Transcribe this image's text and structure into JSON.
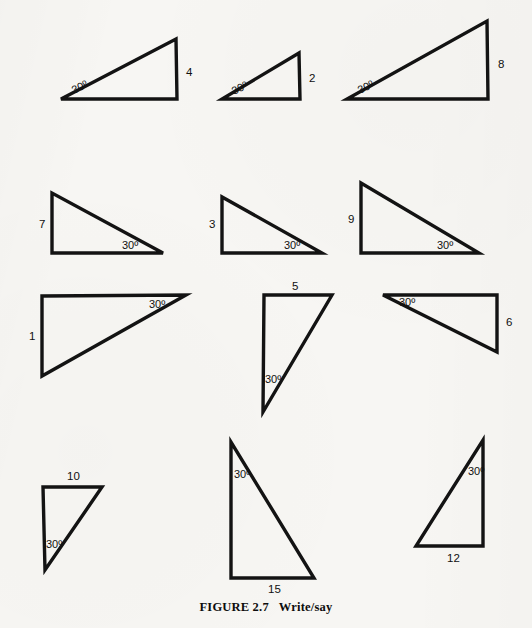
{
  "figure": {
    "caption_label": "FIGURE 2.7",
    "caption_text": "Write/say",
    "angle_text": "30º",
    "background_color": "#f7f6f3",
    "ink_color": "#131313"
  },
  "triangles": [
    {
      "id": "triangle-4",
      "number_label": "4",
      "angle_label": "30º",
      "points": "61,99 177,99 176,39",
      "label_x": 186,
      "label_y": 76,
      "angle_x": 74,
      "angle_y": 94,
      "angle_rotation": -27
    },
    {
      "id": "triangle-2",
      "number_label": "2",
      "angle_label": "30º",
      "points": "222,99 300,99 299,53",
      "label_x": 309,
      "label_y": 82,
      "angle_x": 234,
      "angle_y": 95,
      "angle_rotation": -27
    },
    {
      "id": "triangle-8",
      "number_label": "8",
      "angle_label": "30º",
      "points": "347,99 488,99 487,21",
      "label_x": 498,
      "label_y": 68,
      "angle_x": 360,
      "angle_y": 94,
      "angle_rotation": -27
    },
    {
      "id": "triangle-7",
      "number_label": "7",
      "angle_label": "30º",
      "points": "52,193 52,253 163,253",
      "label_x": 39,
      "label_y": 228,
      "angle_x": 122,
      "angle_y": 249,
      "angle_rotation": 0
    },
    {
      "id": "triangle-3",
      "number_label": "3",
      "angle_label": "30º",
      "points": "222,197 222,253 322,253",
      "label_x": 209,
      "label_y": 228,
      "angle_x": 284,
      "angle_y": 249,
      "angle_rotation": 0
    },
    {
      "id": "triangle-9",
      "number_label": "9",
      "angle_label": "30º",
      "points": "361,183 361,253 479,253",
      "label_x": 348,
      "label_y": 223,
      "angle_x": 437,
      "angle_y": 249,
      "angle_rotation": 0
    },
    {
      "id": "triangle-1",
      "number_label": "1",
      "angle_label": "30º",
      "points": "42,296 186,295 42,376",
      "label_x": 29,
      "label_y": 340,
      "angle_x": 149,
      "angle_y": 308,
      "angle_rotation": 0
    },
    {
      "id": "triangle-5",
      "number_label": "5",
      "angle_label": "30º",
      "points": "264,295 332,295 263,412",
      "label_x": 292,
      "label_y": 290,
      "angle_x": 265,
      "angle_y": 383,
      "angle_rotation": 0
    },
    {
      "id": "triangle-6",
      "number_label": "6",
      "angle_label": "30º",
      "points": "383,295 497,295 497,352",
      "label_x": 506,
      "label_y": 326,
      "angle_x": 399,
      "angle_y": 306,
      "angle_rotation": 0
    },
    {
      "id": "triangle-10",
      "number_label": "10",
      "angle_label": "30º",
      "points": "43,487 102,487 45,570",
      "label_x": 67,
      "label_y": 480,
      "angle_x": 46,
      "angle_y": 548,
      "angle_rotation": 0
    },
    {
      "id": "triangle-15",
      "number_label": "15",
      "angle_label": "30º",
      "points": "231,442 231,578 314,578",
      "label_x": 268,
      "label_y": 593,
      "angle_x": 234,
      "angle_y": 478,
      "angle_rotation": 0
    },
    {
      "id": "triangle-12",
      "number_label": "12",
      "angle_label": "30º",
      "points": "483,440 483,546 416,546",
      "label_x": 447,
      "label_y": 562,
      "angle_x": 468,
      "angle_y": 475,
      "angle_rotation": 0
    }
  ]
}
